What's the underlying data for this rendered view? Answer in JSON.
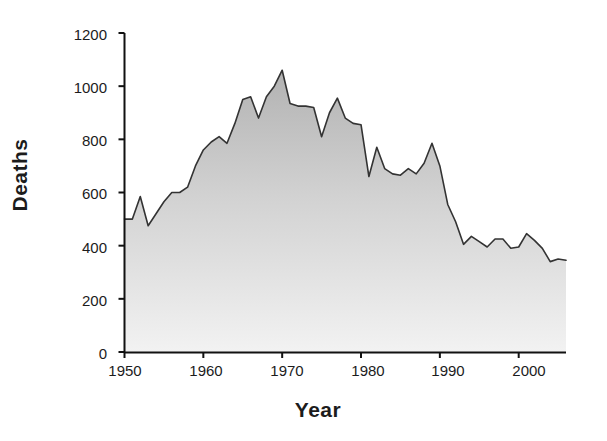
{
  "chart": {
    "type": "area",
    "xlabel": "Year",
    "ylabel": "Deaths"
  },
  "axes": {
    "y_ticks": [
      "1200",
      "1000",
      "800",
      "600",
      "400",
      "200",
      "0"
    ],
    "x_ticks": [
      "1950",
      "1960",
      "1970",
      "1980",
      "1990",
      "2000"
    ]
  },
  "style": {
    "area_fill_top": "#b4b4b4",
    "area_fill_bottom": "#ededed",
    "line_color": "#333333",
    "axis_color": "#111111",
    "background": "#ffffff"
  },
  "chart_data": {
    "type": "area",
    "title": "",
    "xlabel": "Year",
    "ylabel": "Deaths",
    "xlim": [
      1950,
      2006
    ],
    "ylim": [
      0,
      1200
    ],
    "grid": false,
    "legend": null,
    "x": [
      1950,
      1951,
      1952,
      1953,
      1954,
      1955,
      1956,
      1957,
      1958,
      1959,
      1960,
      1961,
      1962,
      1963,
      1964,
      1965,
      1966,
      1967,
      1968,
      1969,
      1970,
      1971,
      1972,
      1973,
      1974,
      1975,
      1976,
      1977,
      1978,
      1979,
      1980,
      1981,
      1982,
      1983,
      1984,
      1985,
      1986,
      1987,
      1988,
      1989,
      1990,
      1991,
      1992,
      1993,
      1994,
      1995,
      1996,
      1997,
      1998,
      1999,
      2000,
      2001,
      2002,
      2003,
      2004,
      2005,
      2006
    ],
    "values": [
      500,
      500,
      585,
      475,
      520,
      565,
      600,
      600,
      620,
      700,
      760,
      790,
      810,
      785,
      860,
      950,
      960,
      880,
      960,
      1000,
      1060,
      935,
      925,
      925,
      920,
      810,
      900,
      955,
      880,
      860,
      855,
      660,
      770,
      690,
      670,
      665,
      690,
      670,
      710,
      785,
      700,
      555,
      490,
      405,
      435,
      415,
      395,
      425,
      425,
      390,
      395,
      445,
      420,
      390,
      340,
      350,
      345
    ],
    "series": [
      {
        "name": "Deaths",
        "values": [
          500,
          500,
          585,
          475,
          520,
          565,
          600,
          600,
          620,
          700,
          760,
          790,
          810,
          785,
          860,
          950,
          960,
          880,
          960,
          1000,
          1060,
          935,
          925,
          925,
          920,
          810,
          900,
          955,
          880,
          860,
          855,
          660,
          770,
          690,
          670,
          665,
          690,
          670,
          710,
          785,
          700,
          555,
          490,
          405,
          435,
          415,
          395,
          425,
          425,
          390,
          395,
          445,
          420,
          390,
          340,
          350,
          345
        ]
      }
    ]
  }
}
